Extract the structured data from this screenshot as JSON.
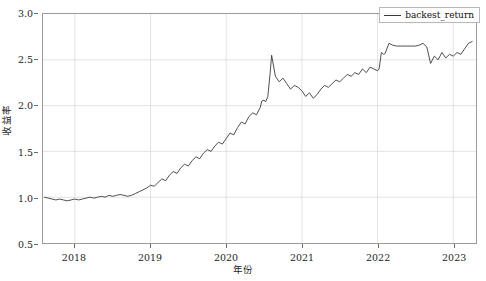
{
  "chart_data": {
    "type": "line",
    "title": "",
    "xlabel": "年份",
    "ylabel": "收益率",
    "xlim": [
      2017.58,
      2023.3
    ],
    "ylim": [
      0.5,
      3.0
    ],
    "grid": true,
    "legend_position": "upper right",
    "line_color": "#3a3a3a",
    "xticks": [
      2018,
      2019,
      2020,
      2021,
      2022,
      2023
    ],
    "xtick_labels": [
      "2018",
      "2019",
      "2020",
      "2021",
      "2022",
      "2023"
    ],
    "yticks": [
      0.5,
      1.0,
      1.5,
      2.0,
      2.5,
      3.0
    ],
    "ytick_labels": [
      "0.5",
      "1.0",
      "1.5",
      "2.0",
      "2.5",
      "3.0"
    ],
    "series": [
      {
        "name": "backest_return",
        "x": [
          2017.6,
          2017.65,
          2017.7,
          2017.75,
          2017.8,
          2017.85,
          2017.9,
          2017.95,
          2018.0,
          2018.05,
          2018.1,
          2018.15,
          2018.2,
          2018.25,
          2018.3,
          2018.35,
          2018.4,
          2018.45,
          2018.5,
          2018.55,
          2018.6,
          2018.65,
          2018.7,
          2018.75,
          2018.8,
          2018.85,
          2018.9,
          2018.95,
          2019.0,
          2019.05,
          2019.1,
          2019.15,
          2019.2,
          2019.25,
          2019.3,
          2019.35,
          2019.4,
          2019.45,
          2019.5,
          2019.55,
          2019.6,
          2019.65,
          2019.7,
          2019.75,
          2019.8,
          2019.85,
          2019.9,
          2019.95,
          2020.0,
          2020.05,
          2020.1,
          2020.15,
          2020.2,
          2020.25,
          2020.3,
          2020.35,
          2020.4,
          2020.45,
          2020.47,
          2020.5,
          2020.52,
          2020.55,
          2020.58,
          2020.6,
          2020.65,
          2020.7,
          2020.75,
          2020.8,
          2020.85,
          2020.9,
          2020.95,
          2021.0,
          2021.05,
          2021.1,
          2021.15,
          2021.2,
          2021.25,
          2021.3,
          2021.35,
          2021.4,
          2021.45,
          2021.5,
          2021.55,
          2021.6,
          2021.65,
          2021.7,
          2021.75,
          2021.8,
          2021.85,
          2021.9,
          2021.95,
          2022.0,
          2022.02,
          2022.05,
          2022.08,
          2022.1,
          2022.15,
          2022.2,
          2022.25,
          2022.3,
          2022.35,
          2022.4,
          2022.45,
          2022.5,
          2022.55,
          2022.6,
          2022.65,
          2022.7,
          2022.75,
          2022.8,
          2022.85,
          2022.9,
          2022.95,
          2023.0,
          2023.05,
          2023.1,
          2023.15,
          2023.2,
          2023.25
        ],
        "y": [
          1.0,
          0.99,
          0.98,
          0.97,
          0.98,
          0.97,
          0.96,
          0.97,
          0.98,
          0.97,
          0.98,
          0.99,
          1.0,
          0.99,
          1.0,
          1.01,
          1.0,
          1.02,
          1.01,
          1.02,
          1.03,
          1.02,
          1.01,
          1.02,
          1.04,
          1.06,
          1.08,
          1.1,
          1.13,
          1.12,
          1.16,
          1.2,
          1.18,
          1.24,
          1.28,
          1.26,
          1.32,
          1.36,
          1.34,
          1.4,
          1.44,
          1.42,
          1.48,
          1.52,
          1.5,
          1.56,
          1.6,
          1.58,
          1.64,
          1.7,
          1.68,
          1.76,
          1.82,
          1.8,
          1.88,
          1.92,
          1.9,
          1.98,
          2.05,
          2.06,
          2.04,
          2.1,
          2.35,
          2.55,
          2.32,
          2.26,
          2.3,
          2.24,
          2.18,
          2.22,
          2.2,
          2.16,
          2.1,
          2.14,
          2.08,
          2.12,
          2.18,
          2.22,
          2.2,
          2.24,
          2.28,
          2.26,
          2.3,
          2.34,
          2.32,
          2.36,
          2.34,
          2.4,
          2.36,
          2.42,
          2.4,
          2.38,
          2.4,
          2.58,
          2.56,
          2.57,
          2.68,
          2.66,
          2.65,
          2.65,
          2.65,
          2.65,
          2.65,
          2.65,
          2.66,
          2.68,
          2.64,
          2.46,
          2.54,
          2.5,
          2.58,
          2.52,
          2.56,
          2.54,
          2.58,
          2.56,
          2.62,
          2.68,
          2.7
        ]
      }
    ]
  },
  "legend": {
    "entries": [
      {
        "label": "backest_return"
      }
    ]
  }
}
